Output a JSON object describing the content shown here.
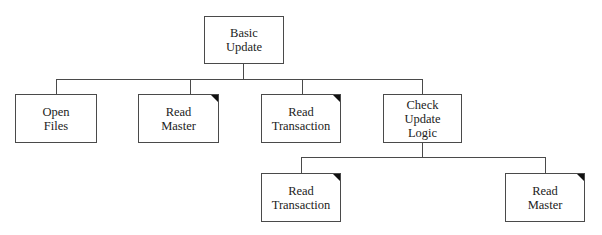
{
  "diagram": {
    "type": "structure-chart",
    "root": {
      "id": "basic-update",
      "lines": [
        "Basic",
        "Update"
      ],
      "predefined": false
    },
    "level1": [
      {
        "id": "open-files",
        "lines": [
          "Open",
          "Files"
        ],
        "predefined": false
      },
      {
        "id": "read-master",
        "lines": [
          "Read",
          "Master"
        ],
        "predefined": true
      },
      {
        "id": "read-transaction",
        "lines": [
          "Read",
          "Transaction"
        ],
        "predefined": true
      },
      {
        "id": "check-update-logic",
        "lines": [
          "Check",
          "Update",
          "Logic"
        ],
        "predefined": false
      }
    ],
    "level2": [
      {
        "id": "read-transaction-2",
        "parent": "check-update-logic",
        "lines": [
          "Read",
          "Transaction"
        ],
        "predefined": true
      },
      {
        "id": "read-master-2",
        "parent": "check-update-logic",
        "lines": [
          "Read",
          "Master"
        ],
        "predefined": true
      }
    ]
  }
}
